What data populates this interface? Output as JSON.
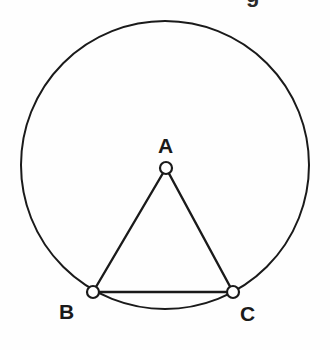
{
  "figure": {
    "title_fragment": "g",
    "background_color": "#fefefe",
    "stroke_color": "#1a1a1a",
    "marker_fill_color": "#ffffff",
    "labels": {
      "A": "A",
      "B": "B",
      "C": "C"
    }
  },
  "chart_data": {
    "type": "diagram",
    "title": "",
    "shapes": [
      {
        "name": "circle",
        "type": "circle",
        "cx": 165,
        "cy": 165,
        "r": 144,
        "fill": "none",
        "stroke": "#1a1a1a",
        "stroke_width": 2
      },
      {
        "name": "triangle-ABC",
        "type": "polygon",
        "points": "166,168 93,292 233,292",
        "fill": "none",
        "stroke": "#1a1a1a",
        "stroke_width": 2.4
      }
    ],
    "points": [
      {
        "label": "A",
        "x": 166,
        "y": 168,
        "marker": "open-circle",
        "radius": 6
      },
      {
        "label": "B",
        "x": 93,
        "y": 292,
        "marker": "open-circle",
        "radius": 6
      },
      {
        "label": "C",
        "x": 233,
        "y": 292,
        "marker": "open-circle",
        "radius": 6
      }
    ],
    "label_positions": [
      {
        "label": "A",
        "x": 158,
        "y": 135
      },
      {
        "label": "B",
        "x": 59,
        "y": 301
      },
      {
        "label": "C",
        "x": 240,
        "y": 303
      }
    ]
  }
}
